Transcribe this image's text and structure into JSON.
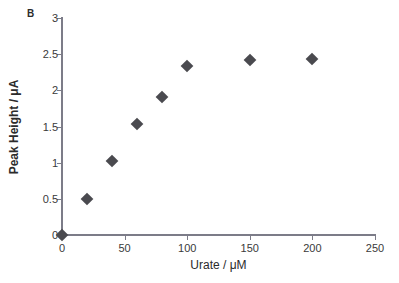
{
  "figure": {
    "panel_label": "B",
    "background": "#ffffff",
    "axis_color": "#7c7c88",
    "marker_color": "#4a4a4f",
    "text_color": "#2b2b2b"
  },
  "chart_data": {
    "type": "scatter",
    "title": "B",
    "xlabel": "Urate / μM",
    "ylabel": "Peak Height / μA",
    "xlim": [
      0,
      250
    ],
    "ylim": [
      0,
      3
    ],
    "grid": false,
    "legend": null,
    "xticks": [
      0,
      50,
      100,
      150,
      200,
      250
    ],
    "xtick_labels": [
      "0",
      "50",
      "100",
      "150",
      "200",
      "250"
    ],
    "yticks": [
      0,
      0.5,
      1,
      1.5,
      2,
      2.5,
      3
    ],
    "ytick_labels": [
      "0",
      "0.5",
      "1",
      "1.5",
      "2",
      "2.5",
      "3"
    ],
    "x": [
      0,
      20,
      40,
      60,
      80,
      100,
      150,
      200
    ],
    "y": [
      0,
      0.5,
      1.02,
      1.53,
      1.91,
      2.33,
      2.42,
      2.44
    ],
    "series": [
      {
        "name": "Peak Height vs Urate",
        "marker": "diamond",
        "color": "#4a4a4f",
        "points": [
          {
            "x": 0,
            "y": 0
          },
          {
            "x": 20,
            "y": 0.5
          },
          {
            "x": 40,
            "y": 1.02
          },
          {
            "x": 60,
            "y": 1.53
          },
          {
            "x": 80,
            "y": 1.91
          },
          {
            "x": 100,
            "y": 2.33
          },
          {
            "x": 150,
            "y": 2.42
          },
          {
            "x": 200,
            "y": 2.44
          }
        ]
      }
    ]
  }
}
